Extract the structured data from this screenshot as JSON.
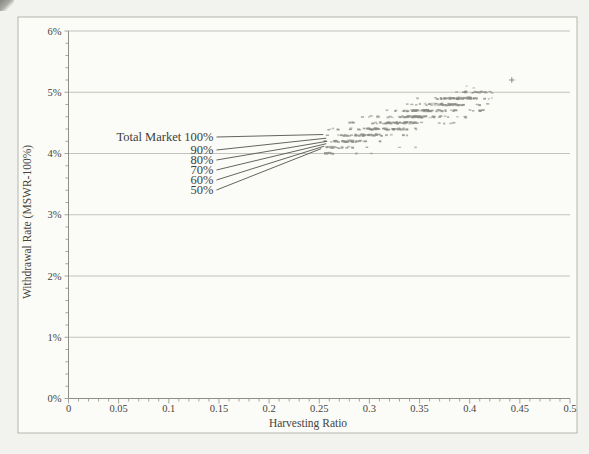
{
  "chart_data": {
    "type": "scatter",
    "title": "",
    "xlabel": "Harvesting Ratio",
    "ylabel": "Withdrawal Rate (MSWR-100%)",
    "xlim": [
      0,
      0.5
    ],
    "ylim_pct": [
      0,
      6
    ],
    "grid": "horizontal",
    "legend": "none",
    "x_tick_values": [
      0,
      0.05,
      0.1,
      0.15,
      0.2,
      0.25,
      0.3,
      0.35,
      0.4,
      0.45,
      0.5
    ],
    "x_tick_labels": [
      "0",
      "0.05",
      "0.1",
      "0.15",
      "0.2",
      "0.25",
      "0.3",
      "0.35",
      "0.4",
      "0.45",
      "0.5"
    ],
    "x_minor_step": 0.01,
    "y_tick_values": [
      0,
      1,
      2,
      3,
      4,
      5,
      6
    ],
    "y_tick_labels": [
      "0%",
      "1%",
      "2%",
      "3%",
      "4%",
      "5%",
      "6%"
    ],
    "y_minor_step": 0.2,
    "callouts": [
      {
        "label": "Total Market 100%",
        "target": {
          "x": 0.254,
          "y_pct": 4.31
        }
      },
      {
        "label": "90%",
        "target": {
          "x": 0.257,
          "y_pct": 4.25
        }
      },
      {
        "label": "80%",
        "target": {
          "x": 0.258,
          "y_pct": 4.2
        }
      },
      {
        "label": "70%",
        "target": {
          "x": 0.257,
          "y_pct": 4.16
        }
      },
      {
        "label": "60%",
        "target": {
          "x": 0.255,
          "y_pct": 4.12
        }
      },
      {
        "label": "50%",
        "target": {
          "x": 0.252,
          "y_pct": 4.08
        }
      }
    ],
    "scatter_rows": [
      {
        "y_pct": 5.0,
        "x_min": 0.374,
        "x_max": 0.447,
        "core": [
          0.392,
          0.428
        ],
        "count": 22
      },
      {
        "y_pct": 4.9,
        "x_min": 0.342,
        "x_max": 0.437,
        "core": [
          0.362,
          0.412
        ],
        "count": 58
      },
      {
        "y_pct": 4.8,
        "x_min": 0.334,
        "x_max": 0.42,
        "core": [
          0.352,
          0.4
        ],
        "count": 50
      },
      {
        "y_pct": 4.7,
        "x_min": 0.308,
        "x_max": 0.414,
        "core": [
          0.33,
          0.388
        ],
        "count": 68
      },
      {
        "y_pct": 4.6,
        "x_min": 0.289,
        "x_max": 0.4,
        "core": [
          0.314,
          0.372
        ],
        "count": 66
      },
      {
        "y_pct": 4.5,
        "x_min": 0.279,
        "x_max": 0.392,
        "core": [
          0.3,
          0.356
        ],
        "count": 58
      },
      {
        "y_pct": 4.4,
        "x_min": 0.252,
        "x_max": 0.372,
        "core": [
          0.286,
          0.344
        ],
        "count": 62
      },
      {
        "y_pct": 4.3,
        "x_min": 0.251,
        "x_max": 0.34,
        "core": [
          0.268,
          0.32
        ],
        "count": 46
      },
      {
        "y_pct": 4.2,
        "x_min": 0.25,
        "x_max": 0.322,
        "core": [
          0.258,
          0.3
        ],
        "count": 36
      },
      {
        "y_pct": 4.1,
        "x_min": 0.25,
        "x_max": 0.3,
        "core": [
          0.252,
          0.285
        ],
        "count": 20
      },
      {
        "y_pct": 4.0,
        "x_min": 0.25,
        "x_max": 0.274,
        "core": [
          0.25,
          0.268
        ],
        "count": 9
      }
    ],
    "extra_points": [
      {
        "x": 0.33,
        "y_pct": 4.1
      },
      {
        "x": 0.346,
        "y_pct": 4.1
      },
      {
        "x": 0.287,
        "y_pct": 4.0
      },
      {
        "x": 0.302,
        "y_pct": 4.0
      },
      {
        "x": 0.397,
        "y_pct": 5.1
      },
      {
        "x": 0.404,
        "y_pct": 5.07
      }
    ],
    "outlier": {
      "x": 0.442,
      "y_pct": 5.2,
      "marker": "plus"
    },
    "colors": {
      "marker": "#8a8a84",
      "grid": "#aeaea7",
      "axis": "#8f8f88",
      "text": "#45453f",
      "page_background": "#f2f2ee",
      "panel_background": "#fbfbf7",
      "border": "#b6b6af"
    }
  }
}
